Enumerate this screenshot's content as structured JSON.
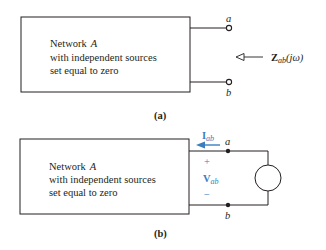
{
  "figure_a": {
    "network_line1": "Network",
    "network_name": "A",
    "network_line2": "with independent sources",
    "network_line3": "set equal to zero",
    "terminal_top": "a",
    "terminal_bottom": "b",
    "impedance_symbol": "Z",
    "impedance_subscript": "ab",
    "impedance_arg": "(jω)",
    "caption": "(a)"
  },
  "figure_b": {
    "network_line1": "Network",
    "network_name": "A",
    "network_line2": "with independent sources",
    "network_line3": "set equal to zero",
    "terminal_top": "a",
    "terminal_bottom": "b",
    "current_symbol": "I",
    "current_subscript": "ab",
    "voltage_symbol": "V",
    "voltage_subscript": "ab",
    "plus_sign": "+",
    "minus_sign": "−",
    "caption": "(b)"
  },
  "colors": {
    "line": "#231f20",
    "accent": "#3a7ec0"
  }
}
